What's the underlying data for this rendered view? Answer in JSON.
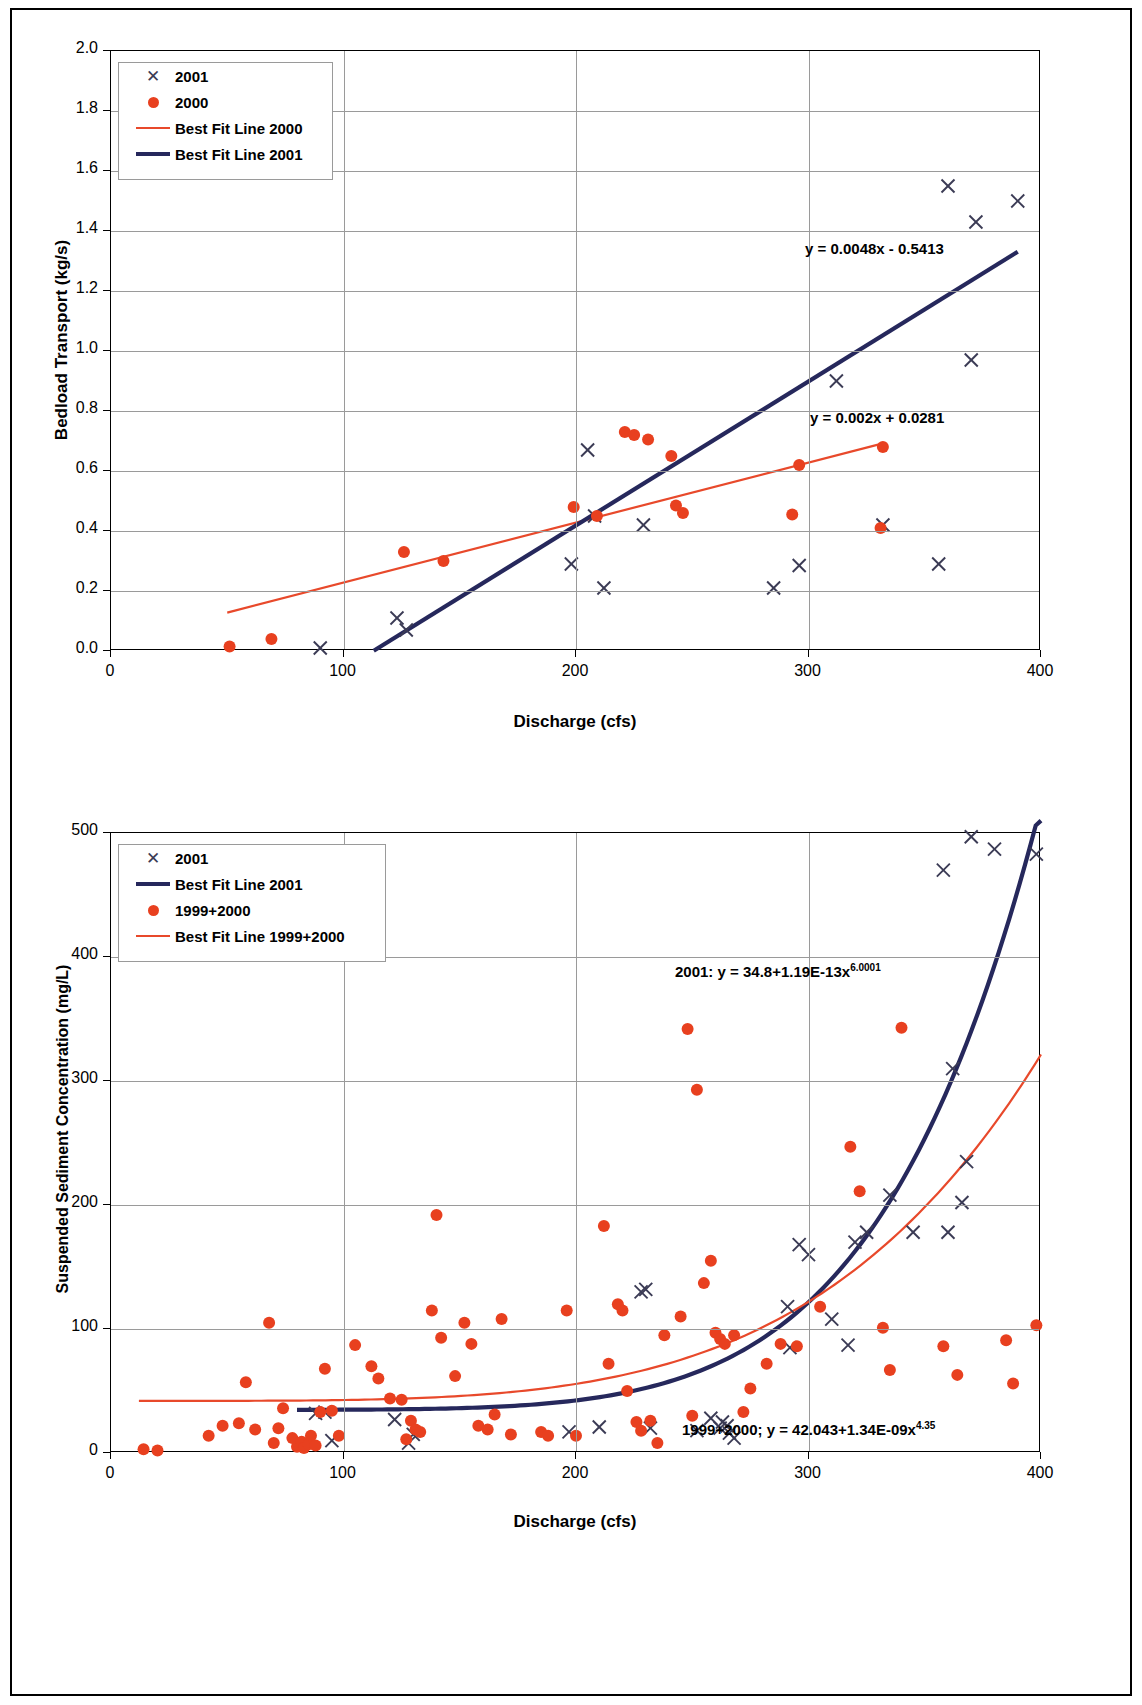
{
  "chart_data": [
    {
      "id": "bedload",
      "type": "scatter",
      "title": "",
      "xlabel": "Discharge (cfs)",
      "ylabel": "Bedload Transport (kg/s)",
      "xlim": [
        0,
        400
      ],
      "ylim": [
        0,
        2.0
      ],
      "xticks": [
        0,
        100,
        200,
        300,
        400
      ],
      "yticks": [
        0.0,
        0.2,
        0.4,
        0.6,
        0.8,
        1.0,
        1.2,
        1.4,
        1.6,
        1.8,
        2.0
      ],
      "ytick_labels": [
        "0.0",
        "0.2",
        "0.4",
        "0.6",
        "0.8",
        "1.0",
        "1.2",
        "1.4",
        "1.6",
        "1.8",
        "2.0"
      ],
      "xtick_labels": [
        "0",
        "100",
        "200",
        "300",
        "400"
      ],
      "grid": true,
      "legend_position": "top-left",
      "legend": [
        {
          "label": "2001",
          "marker": "x",
          "color": "#3b3b55"
        },
        {
          "label": "2000",
          "marker": "dot",
          "color": "#e8401f"
        },
        {
          "label": "Best Fit Line 2000",
          "marker": "line",
          "color": "#e8492b"
        },
        {
          "label": "Best Fit Line 2001",
          "marker": "line",
          "color": "#26285c"
        }
      ],
      "annotations": [
        {
          "text": "y = 0.0048x - 0.5413",
          "x": 292,
          "y": 1.4
        },
        {
          "text": "y = 0.002x + 0.0281",
          "x": 292,
          "y": 0.8
        }
      ],
      "series": [
        {
          "name": "2001",
          "marker": "x",
          "color": "#3b3b55",
          "points": [
            [
              90,
              0.01
            ],
            [
              123,
              0.11
            ],
            [
              127,
              0.07
            ],
            [
              198,
              0.29
            ],
            [
              205,
              0.67
            ],
            [
              208,
              0.45
            ],
            [
              212,
              0.21
            ],
            [
              229,
              0.42
            ],
            [
              285,
              0.21
            ],
            [
              296,
              0.285
            ],
            [
              312,
              0.9
            ],
            [
              332,
              0.42
            ],
            [
              356,
              0.29
            ],
            [
              360,
              1.55
            ],
            [
              370,
              0.97
            ],
            [
              372,
              1.43
            ],
            [
              390,
              1.5
            ]
          ]
        },
        {
          "name": "2000",
          "marker": "dot",
          "color": "#e8401f",
          "points": [
            [
              51,
              0.015
            ],
            [
              69,
              0.04
            ],
            [
              126,
              0.33
            ],
            [
              143,
              0.3
            ],
            [
              199,
              0.48
            ],
            [
              209,
              0.45
            ],
            [
              221,
              0.73
            ],
            [
              225,
              0.72
            ],
            [
              231,
              0.705
            ],
            [
              241,
              0.65
            ],
            [
              243,
              0.485
            ],
            [
              246,
              0.46
            ],
            [
              293,
              0.455
            ],
            [
              296,
              0.62
            ],
            [
              331,
              0.41
            ],
            [
              332,
              0.68
            ]
          ]
        }
      ],
      "fits": [
        {
          "name": "Best Fit Line 2000",
          "color": "#e8492b",
          "equation": "y = 0.002x + 0.0281",
          "kind": "linear",
          "slope": 0.002,
          "intercept": 0.0281,
          "x_range": [
            50,
            332
          ]
        },
        {
          "name": "Best Fit Line 2001",
          "color": "#26285c",
          "equation": "y = 0.0048x - 0.5413",
          "kind": "linear",
          "slope": 0.0048,
          "intercept": -0.5413,
          "x_range": [
            113,
            390
          ]
        }
      ]
    },
    {
      "id": "ssc",
      "type": "scatter",
      "title": "",
      "xlabel": "Discharge (cfs)",
      "ylabel": "Suspended Sediment Concentration (mg/L)",
      "xlim": [
        0,
        400
      ],
      "ylim": [
        0,
        500
      ],
      "xticks": [
        0,
        100,
        200,
        300,
        400
      ],
      "yticks": [
        0,
        100,
        200,
        300,
        400,
        500
      ],
      "ytick_labels": [
        "0",
        "100",
        "200",
        "300",
        "400",
        "500"
      ],
      "xtick_labels": [
        "0",
        "100",
        "200",
        "300",
        "400"
      ],
      "grid": true,
      "legend_position": "top-left",
      "legend": [
        {
          "label": "2001",
          "marker": "x",
          "color": "#3b3b55"
        },
        {
          "label": "Best Fit Line 2001",
          "marker": "line",
          "color": "#26285c"
        },
        {
          "label": "1999+2000",
          "marker": "dot",
          "color": "#e8401f"
        },
        {
          "label": "Best Fit Line 1999+2000",
          "marker": "line",
          "color": "#e8492b"
        }
      ],
      "annotations": [
        {
          "text": "2001: y = 34.8+1.19E-13x",
          "sup": "6.0001",
          "x": 258,
          "y": 392
        },
        {
          "text": "1999+2000; y = 42.043+1.34E-09x",
          "sup": "4.35",
          "x": 242,
          "y": 14
        }
      ],
      "series": [
        {
          "name": "2001",
          "marker": "x",
          "color": "#3b3b55",
          "points": [
            [
              88,
              32
            ],
            [
              92,
              33
            ],
            [
              95,
              10
            ],
            [
              122,
              27
            ],
            [
              128,
              8
            ],
            [
              130,
              15
            ],
            [
              197,
              17
            ],
            [
              210,
              21
            ],
            [
              228,
              130
            ],
            [
              230,
              132
            ],
            [
              232,
              20
            ],
            [
              252,
              18
            ],
            [
              258,
              28
            ],
            [
              262,
              20
            ],
            [
              263,
              25
            ],
            [
              265,
              22
            ],
            [
              266,
              16
            ],
            [
              268,
              12
            ],
            [
              291,
              118
            ],
            [
              292,
              85
            ],
            [
              296,
              168
            ],
            [
              300,
              160
            ],
            [
              310,
              108
            ],
            [
              317,
              87
            ],
            [
              320,
              170
            ],
            [
              325,
              178
            ],
            [
              335,
              208
            ],
            [
              345,
              178
            ],
            [
              358,
              470
            ],
            [
              360,
              178
            ],
            [
              362,
              310
            ],
            [
              366,
              202
            ],
            [
              368,
              235
            ],
            [
              370,
              497
            ],
            [
              380,
              487
            ],
            [
              398,
              483
            ]
          ]
        },
        {
          "name": "1999+2000",
          "marker": "dot",
          "color": "#e8401f",
          "points": [
            [
              14,
              3
            ],
            [
              20,
              2
            ],
            [
              42,
              14
            ],
            [
              48,
              22
            ],
            [
              55,
              24
            ],
            [
              58,
              57
            ],
            [
              62,
              19
            ],
            [
              68,
              105
            ],
            [
              70,
              8
            ],
            [
              72,
              20
            ],
            [
              74,
              36
            ],
            [
              78,
              12
            ],
            [
              80,
              5
            ],
            [
              82,
              9
            ],
            [
              83,
              4
            ],
            [
              85,
              7
            ],
            [
              86,
              14
            ],
            [
              88,
              6
            ],
            [
              90,
              33
            ],
            [
              92,
              68
            ],
            [
              95,
              34
            ],
            [
              98,
              14
            ],
            [
              105,
              87
            ],
            [
              112,
              70
            ],
            [
              115,
              60
            ],
            [
              120,
              44
            ],
            [
              125,
              43
            ],
            [
              127,
              11
            ],
            [
              129,
              26
            ],
            [
              131,
              19
            ],
            [
              133,
              17
            ],
            [
              138,
              115
            ],
            [
              140,
              192
            ],
            [
              142,
              93
            ],
            [
              148,
              62
            ],
            [
              152,
              105
            ],
            [
              155,
              88
            ],
            [
              158,
              22
            ],
            [
              162,
              19
            ],
            [
              165,
              31
            ],
            [
              168,
              108
            ],
            [
              172,
              15
            ],
            [
              185,
              17
            ],
            [
              188,
              14
            ],
            [
              196,
              115
            ],
            [
              200,
              14
            ],
            [
              212,
              183
            ],
            [
              214,
              72
            ],
            [
              218,
              120
            ],
            [
              220,
              115
            ],
            [
              222,
              50
            ],
            [
              226,
              25
            ],
            [
              228,
              18
            ],
            [
              232,
              26
            ],
            [
              235,
              8
            ],
            [
              238,
              95
            ],
            [
              245,
              110
            ],
            [
              248,
              342
            ],
            [
              250,
              30
            ],
            [
              252,
              293
            ],
            [
              255,
              137
            ],
            [
              258,
              155
            ],
            [
              260,
              97
            ],
            [
              262,
              92
            ],
            [
              264,
              88
            ],
            [
              268,
              95
            ],
            [
              272,
              33
            ],
            [
              275,
              52
            ],
            [
              282,
              72
            ],
            [
              288,
              88
            ],
            [
              295,
              86
            ],
            [
              305,
              118
            ],
            [
              318,
              247
            ],
            [
              322,
              211
            ],
            [
              332,
              101
            ],
            [
              335,
              67
            ],
            [
              340,
              343
            ],
            [
              358,
              86
            ],
            [
              364,
              63
            ],
            [
              385,
              91
            ],
            [
              388,
              56
            ],
            [
              398,
              103
            ]
          ]
        }
      ],
      "fits": [
        {
          "name": "Best Fit Line 2001",
          "color": "#26285c",
          "equation": "2001: y = 34.8+1.19E-13x^6.0001",
          "kind": "power-offset",
          "offset": 34.8,
          "coefficient": 1.19e-13,
          "exponent": 6.0001,
          "x_range": [
            80,
            400
          ]
        },
        {
          "name": "Best Fit Line 1999+2000",
          "color": "#e8492b",
          "equation": "1999+2000; y = 42.043+1.34E-09x^4.35",
          "kind": "power-offset",
          "offset": 42.043,
          "coefficient": 1.34e-09,
          "exponent": 4.35,
          "x_range": [
            12,
            400
          ]
        }
      ]
    }
  ]
}
